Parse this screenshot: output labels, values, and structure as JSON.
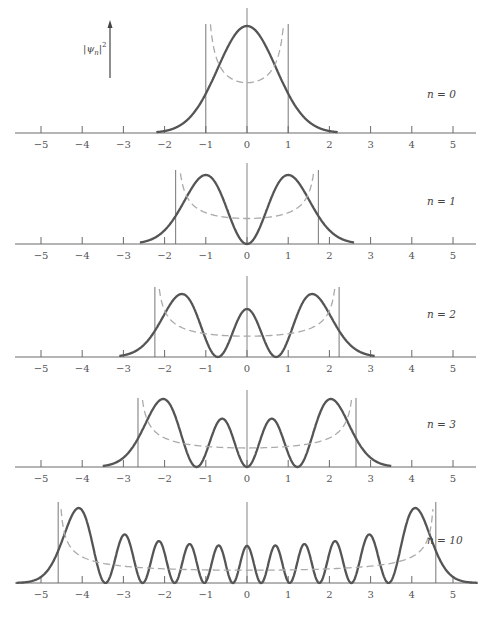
{
  "chart_data": {
    "type": "line",
    "title": "",
    "ylabel": "|ψ_n|²",
    "ylabel_parts": {
      "bar_open": "|",
      "psi": "ψ",
      "sub": "n",
      "bar_close": "|",
      "sup": "2"
    },
    "xlabel": "",
    "xlim": [
      -5.6,
      5.6
    ],
    "x_ticks": [
      -5,
      -4,
      -3,
      -2,
      -1,
      0,
      1,
      2,
      3,
      4,
      5
    ],
    "x_tick_labels": [
      "−5",
      "−4",
      "−3",
      "−2",
      "−1",
      "0",
      "1",
      "2",
      "3",
      "4",
      "5"
    ],
    "grid": false,
    "legend": "none",
    "panels": [
      {
        "n": 0,
        "label": "n = 0",
        "turning_points": [
          -1.0,
          1.0
        ],
        "curve_range": [
          -2.2,
          2.2
        ],
        "series": [
          {
            "name": "quantum probability density |ψ0|²",
            "style": "solid"
          },
          {
            "name": "classical probability density",
            "style": "dashed"
          }
        ]
      },
      {
        "n": 1,
        "label": "n = 1",
        "turning_points": [
          -1.732,
          1.732
        ],
        "curve_range": [
          -2.6,
          2.6
        ],
        "series": [
          {
            "name": "quantum probability density |ψ1|²",
            "style": "solid"
          },
          {
            "name": "classical probability density",
            "style": "dashed"
          }
        ]
      },
      {
        "n": 2,
        "label": "n = 2",
        "turning_points": [
          -2.236,
          2.236
        ],
        "curve_range": [
          -3.1,
          3.1
        ],
        "series": [
          {
            "name": "quantum probability density |ψ2|²",
            "style": "solid"
          },
          {
            "name": "classical probability density",
            "style": "dashed"
          }
        ]
      },
      {
        "n": 3,
        "label": "n = 3",
        "turning_points": [
          -2.646,
          2.646
        ],
        "curve_range": [
          -3.5,
          3.5
        ],
        "series": [
          {
            "name": "quantum probability density |ψ3|²",
            "style": "solid"
          },
          {
            "name": "classical probability density",
            "style": "dashed"
          }
        ]
      },
      {
        "n": 10,
        "label": "n = 10",
        "turning_points": [
          -4.583,
          4.583
        ],
        "curve_range": [
          -5.6,
          5.6
        ],
        "series": [
          {
            "name": "quantum probability density |ψ10|²",
            "style": "solid"
          },
          {
            "name": "classical probability density",
            "style": "dashed"
          }
        ]
      }
    ]
  }
}
